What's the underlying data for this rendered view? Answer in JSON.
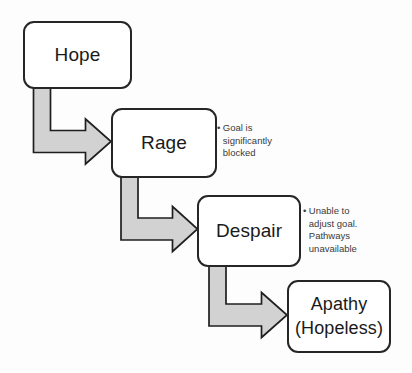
{
  "diagram": {
    "type": "flowchart",
    "background_color": "#fdfdfd",
    "box_border_color": "#262626",
    "box_fill_color": "#ffffff",
    "arrow_fill_color": "#d2d2d2",
    "arrow_stroke_color": "#1f1f1f",
    "nodes": [
      {
        "id": "hope",
        "label": "Hope",
        "line2": ""
      },
      {
        "id": "rage",
        "label": "Rage",
        "line2": ""
      },
      {
        "id": "despair",
        "label": "Despair",
        "line2": ""
      },
      {
        "id": "apathy",
        "label": "Apathy",
        "line2": "(Hopeless)"
      }
    ],
    "annotations": [
      {
        "id": "rage-note",
        "bullet": "•",
        "text": "Goal is\nsignificantly\nblocked"
      },
      {
        "id": "despair-note",
        "bullet": "•",
        "text": "Unable to\nadjust goal.\nPathways\nunavailable"
      }
    ],
    "edges": [
      {
        "from": "hope",
        "to": "rage",
        "style": "elbow-block-arrow"
      },
      {
        "from": "rage",
        "to": "despair",
        "style": "elbow-block-arrow"
      },
      {
        "from": "despair",
        "to": "apathy",
        "style": "elbow-block-arrow"
      }
    ]
  }
}
